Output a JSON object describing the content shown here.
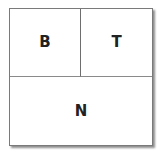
{
  "diagram": {
    "type": "layout-partition",
    "regions": [
      {
        "id": "top-left",
        "label": "B"
      },
      {
        "id": "top-right",
        "label": "T"
      },
      {
        "id": "bottom",
        "label": "N"
      }
    ]
  }
}
